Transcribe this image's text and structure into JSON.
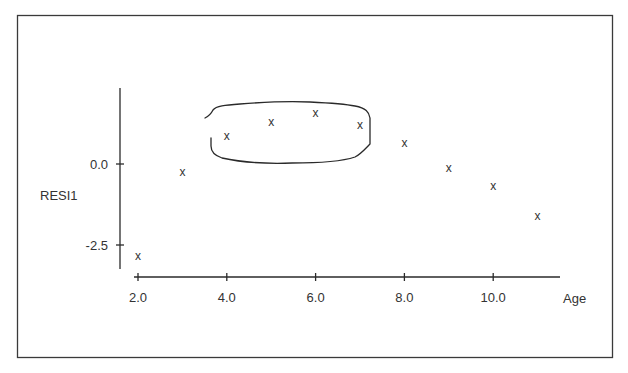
{
  "chart_data": {
    "type": "scatter",
    "title": "",
    "xlabel": "Age",
    "ylabel": "RESI1",
    "x_ticks": [
      "2.0",
      "4.0",
      "6.0",
      "8.0",
      "10.0"
    ],
    "x_tick_values": [
      2,
      4,
      6,
      8,
      10
    ],
    "y_ticks": [
      "0.0",
      "-2.5"
    ],
    "y_tick_values": [
      0,
      -2.5
    ],
    "xlim": [
      2,
      11.5
    ],
    "ylim": [
      -3.1,
      2.3
    ],
    "grid": false,
    "legend": null,
    "marker": "x",
    "series": [
      {
        "name": "RESI1",
        "x": [
          2,
          3,
          4,
          5,
          6,
          7,
          8,
          9,
          10,
          11
        ],
        "y": [
          -2.84,
          -0.25,
          0.86,
          1.3,
          1.57,
          1.2,
          0.65,
          -0.12,
          -0.68,
          -1.6
        ]
      }
    ],
    "annotations": [
      {
        "type": "hand-drawn-enclosure",
        "description": "freehand loop circling the points at Age 4 through 7",
        "encloses_x": [
          4,
          5,
          6,
          7
        ]
      }
    ]
  },
  "colors": {
    "ink": "#2a2a2a",
    "background": "#ffffff"
  }
}
